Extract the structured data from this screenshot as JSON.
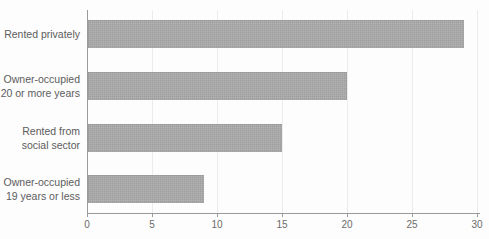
{
  "chart_data": {
    "type": "bar",
    "orientation": "horizontal",
    "title": "",
    "xlabel": "",
    "ylabel": "",
    "categories": [
      [
        "Rented privately"
      ],
      [
        "Owner-occupied",
        "20 or more years"
      ],
      [
        "Rented from",
        "social sector"
      ],
      [
        "Owner-occupied",
        "19 years or less"
      ]
    ],
    "values": [
      29,
      20,
      15,
      9
    ],
    "xlim": [
      0,
      30
    ],
    "xticks": [
      0,
      5,
      10,
      15,
      20,
      25,
      30
    ],
    "grid": true,
    "legend": null,
    "colors": {
      "bar_fill": "#a8a8a8",
      "gridline": "#ececec",
      "axis": "#9a9a9a",
      "tick_label": "#6b6b6b",
      "category_label": "#5c5c5c",
      "background": "#fdfdfd"
    }
  }
}
